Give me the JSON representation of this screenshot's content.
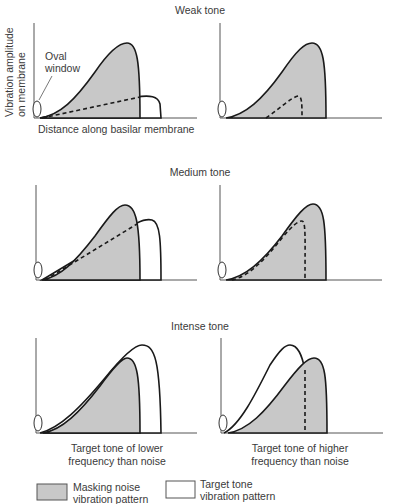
{
  "panels": {
    "weak": {
      "title": "Weak tone"
    },
    "medium": {
      "title": "Medium tone"
    },
    "intense": {
      "title": "Intense tone"
    }
  },
  "axes": {
    "y_label_line1": "Vibration amplitude",
    "y_label_line2": "on membrane",
    "x_label": "Distance along basilar membrane"
  },
  "annotations": {
    "oval_window_line1": "Oval",
    "oval_window_line2": "window"
  },
  "captions": {
    "left_line1": "Target tone of lower",
    "left_line2": "frequency than noise",
    "right_line1": "Target tone of higher",
    "right_line2": "frequency than noise"
  },
  "legend": {
    "noise_line1": "Masking noise",
    "noise_line2": "vibration pattern",
    "tone_line1": "Target tone",
    "tone_line2": "vibration pattern"
  },
  "colors": {
    "noise_fill": "#c8c8c8",
    "tone_fill": "#ffffff",
    "outline": "#1a1a1a"
  }
}
